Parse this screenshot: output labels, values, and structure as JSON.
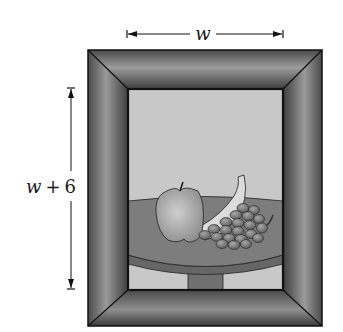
{
  "figure": {
    "type": "framed-picture-dimension-diagram",
    "width_label_var": "w",
    "height_label_var": "w",
    "height_label_op": "+",
    "height_label_num": "6",
    "picture_subject": "still life: apple, banana and grapes on a round table",
    "colors": {
      "frame_dark": "#3f3f3f",
      "frame_mid": "#6a6a6a",
      "frame_light": "#9a9a9a",
      "canvas_bg": "#c9c9c9",
      "table_top": "#7c7c7c",
      "table_edge": "#6c6c6c",
      "apple": "#b4b4b4",
      "banana": "#dddddd",
      "grapes": "#888888",
      "outline": "#111111"
    }
  }
}
